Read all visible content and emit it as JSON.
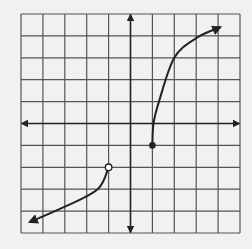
{
  "chart_data": {
    "type": "line",
    "title": "",
    "xlabel": "",
    "ylabel": "",
    "xlim": [
      -5,
      5
    ],
    "ylim": [
      -5,
      5
    ],
    "grid": true,
    "legend": null,
    "series": [
      {
        "name": "left-piece",
        "points": [
          [
            -1,
            -2
          ],
          [
            -1.5,
            -3
          ],
          [
            -3,
            -3.8
          ],
          [
            -4.6,
            -4.5
          ]
        ],
        "start_marker": "open-circle",
        "end_marker": "arrow"
      },
      {
        "name": "right-piece",
        "points": [
          [
            1,
            -1
          ],
          [
            1.05,
            0
          ],
          [
            1.3,
            1
          ],
          [
            2,
            3
          ],
          [
            3,
            3.9
          ],
          [
            4.1,
            4.4
          ]
        ],
        "start_marker": "closed-circle",
        "end_marker": "arrow"
      }
    ]
  },
  "colors": {
    "background": "#f1f1f1",
    "grid": "#555555",
    "curve": "#222222"
  }
}
